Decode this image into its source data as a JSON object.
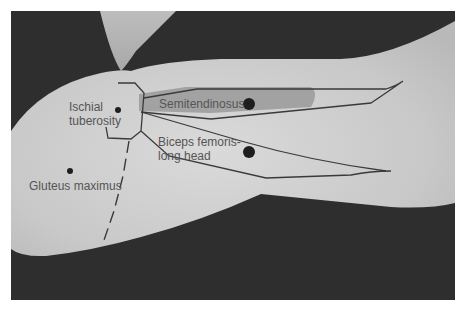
{
  "figure": {
    "type": "anatomical illustration",
    "labels": {
      "ischial_tuberosity": [
        "Ischial",
        "tuberosity"
      ],
      "semitendinosus": "Semitendinosus",
      "biceps_femoris": [
        "Biceps femoris-",
        "long head"
      ],
      "gluteus_maximus": "Gluteus maximus"
    },
    "colors": {
      "background": "#2e2e2e",
      "limb": "#c9c9c9",
      "limb_highlight": "#d8d8d8",
      "semitendinosus_fill": "#9a9a9a",
      "outline": "#3a3a3a",
      "label_text": "#555555",
      "marker_dot": "#1e1e1e"
    }
  }
}
